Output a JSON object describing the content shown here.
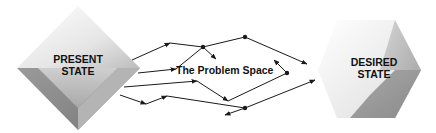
{
  "diagram": {
    "present_state": {
      "line1": "PRESENT",
      "line2": "STATE"
    },
    "desired_state": {
      "line1": "DESIRED",
      "line2": "STATE"
    },
    "problem_space_label": "The Problem Space"
  },
  "colors": {
    "line": "#1a1a1a",
    "shape_light": "#f4f4f4",
    "shape_mid": "#c9c9c9",
    "shape_dark": "#8f8f8f",
    "text": "#111111"
  }
}
